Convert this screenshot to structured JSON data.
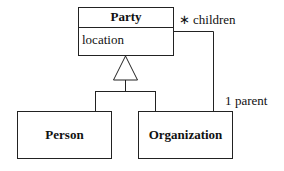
{
  "diagram": {
    "classes": {
      "party": {
        "name": "Party",
        "attribute": "location"
      },
      "person": {
        "name": "Person"
      },
      "organization": {
        "name": "Organization"
      }
    },
    "association": {
      "children_label": "children",
      "children_multiplicity": "∗",
      "parent_label": "parent",
      "parent_multiplicity": "1"
    }
  }
}
